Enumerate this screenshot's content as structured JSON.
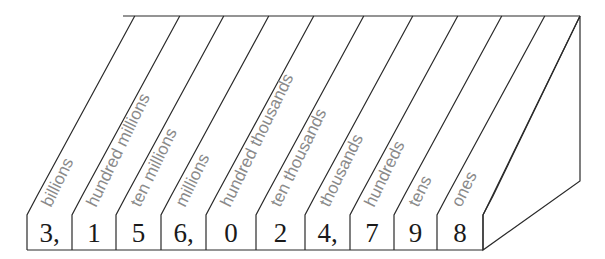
{
  "number": "3,156,024,798",
  "colors": {
    "line": "#2a2a2a",
    "digit": "#1a1a1a",
    "label": "#8a8a8a",
    "background": "#ffffff"
  },
  "columns": [
    {
      "place": "billions",
      "digit": "3,"
    },
    {
      "place": "hundred millions",
      "digit": "1"
    },
    {
      "place": "ten millions",
      "digit": "5"
    },
    {
      "place": "millions",
      "digit": "6,"
    },
    {
      "place": "hundred thousands",
      "digit": "0"
    },
    {
      "place": "ten thousands",
      "digit": "2"
    },
    {
      "place": "thousands",
      "digit": "4,"
    },
    {
      "place": "hundreds",
      "digit": "7"
    },
    {
      "place": "tens",
      "digit": "9"
    },
    {
      "place": "ones",
      "digit": "8"
    }
  ]
}
